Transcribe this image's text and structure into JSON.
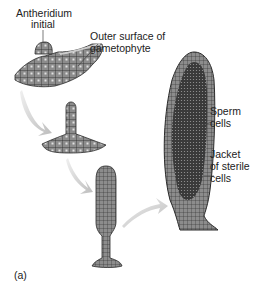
{
  "figure": {
    "panel_label": "(a)",
    "stages": [
      {
        "name": "stage-1",
        "description": "Antheridium initial on gametophyte surface"
      },
      {
        "name": "stage-2",
        "description": "Elongating antheridium"
      },
      {
        "name": "stage-3",
        "description": "Developing antheridium"
      },
      {
        "name": "stage-4",
        "description": "Mature antheridium"
      }
    ],
    "labels": {
      "antheridium_initial_1": "Antheridium",
      "antheridium_initial_2": "initial",
      "outer_surface_1": "Outer surface of",
      "outer_surface_2": "gametophyte",
      "sperm_1": "Sperm",
      "sperm_2": "cells",
      "jacket_1": "Jacket",
      "jacket_2": "of sterile",
      "jacket_3": "cells"
    },
    "colors": {
      "tissue": "#8c8c8c",
      "cell_wall": "#2a2a2a",
      "sperm_mass": "#3a3a3a",
      "arrow": "#c8c8c8",
      "text": "#222222"
    }
  }
}
